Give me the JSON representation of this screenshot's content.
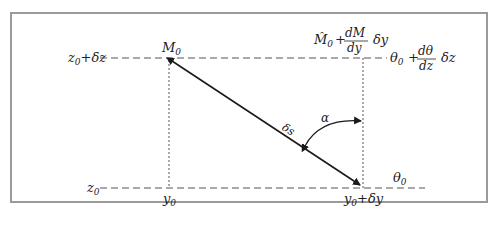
{
  "diagram": {
    "type": "geometry",
    "colors": {
      "frame": "#9a9a9a",
      "line": "#1a1a1a",
      "guide": "#555555"
    },
    "labels": {
      "z_top": "z",
      "z_top_sub": "0",
      "z_top_suffix": "+δz",
      "z_bottom": "z",
      "z_bottom_sub": "0",
      "m0": "M",
      "m0_sub": "0",
      "y0": "y",
      "y0_sub": "0",
      "y0dy": "y",
      "y0dy_sub": "0",
      "y0dy_suffix": "+δy",
      "theta_bottom": "θ",
      "theta_bottom_sub": "0",
      "m_hat_expr": {
        "lead": "M̂",
        "lead_sub": "0",
        "plus": "+",
        "num": "dM",
        "den": "dy",
        "tail": "δy"
      },
      "theta_expr": {
        "lead": "θ",
        "lead_sub": "0",
        "plus": "+",
        "num": "dθ",
        "den": "dz",
        "tail": "δz"
      },
      "alpha": "α",
      "ds": "δs"
    }
  }
}
